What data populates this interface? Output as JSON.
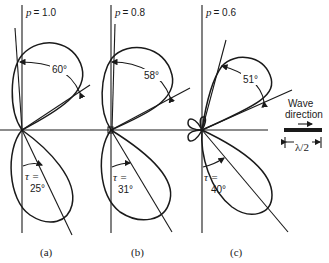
{
  "figure": {
    "panels": [
      {
        "id": "a",
        "caption": "(a)",
        "p_label": "p",
        "p_value": "= 1.0",
        "beamwidth_label": "60°",
        "tau_label": "τ =",
        "tau_value": "25°"
      },
      {
        "id": "b",
        "caption": "(b)",
        "p_label": "p",
        "p_value": "= 0.8",
        "beamwidth_label": "58°",
        "tau_label": "τ =",
        "tau_value": "31°"
      },
      {
        "id": "c",
        "caption": "(c)",
        "p_label": "p",
        "p_value": "= 0.6",
        "beamwidth_label": "51°",
        "tau_label": "τ =",
        "tau_value": "40°"
      }
    ],
    "legend": {
      "line1": "Wave",
      "line2": "direction",
      "dimension": "λ/2"
    }
  }
}
